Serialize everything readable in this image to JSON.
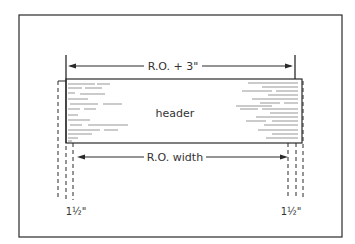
{
  "diagram": {
    "header_label": "header",
    "top_dimension_label": "R.O. + 3\"",
    "bottom_dimension_label": "R.O. width",
    "left_offset_label": "1½\"",
    "right_offset_label": "1½\"",
    "colors": {
      "line": "#2a2a2a",
      "grain": "#6a6a6a",
      "background": "#ffffff"
    }
  }
}
